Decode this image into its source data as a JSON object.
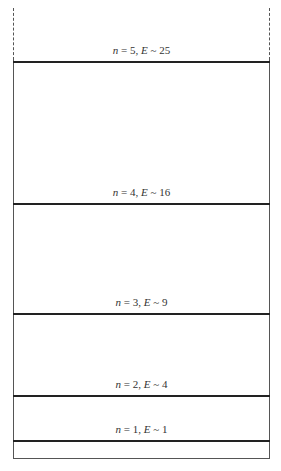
{
  "diagram": {
    "levels": [
      {
        "n": "5",
        "E": "25",
        "label_n": "n",
        "label_E": "E",
        "text": "n = 5, E ~ 25"
      },
      {
        "n": "4",
        "E": "16",
        "label_n": "n",
        "label_E": "E",
        "text": "n = 4, E ~ 16"
      },
      {
        "n": "3",
        "E": "9",
        "label_n": "n",
        "label_E": "E",
        "text": "n = 3, E ~ 9"
      },
      {
        "n": "2",
        "E": "4",
        "label_n": "n",
        "label_E": "E",
        "text": "n = 2, E ~ 4"
      },
      {
        "n": "1",
        "E": "1",
        "label_n": "n",
        "label_E": "E",
        "text": "n = 1, E ~ 1"
      }
    ],
    "colors": {
      "line": "#222222",
      "wall": "#555555",
      "text": "#333333"
    }
  }
}
